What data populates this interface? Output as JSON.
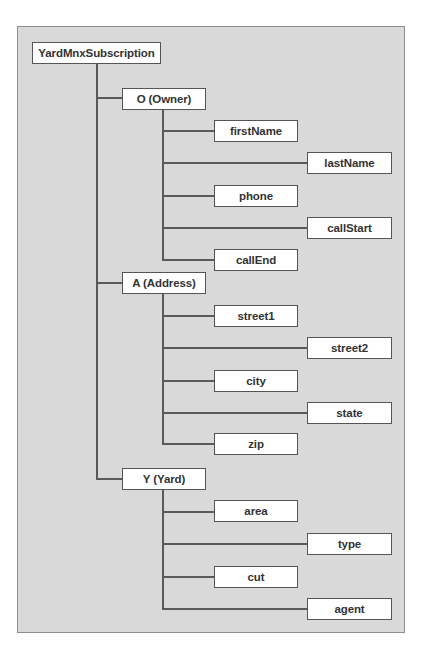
{
  "diagram": {
    "type": "tree",
    "colors": {
      "frame_background": "#d9d9d9",
      "frame_border": "#8e8e8e",
      "node_background": "#ffffff",
      "node_border": "#555555",
      "line": "#5a5a5a",
      "text": "#333333"
    },
    "root": {
      "label": "YardMnxSubscription"
    },
    "groups": [
      {
        "label": "O (Owner)",
        "children": [
          {
            "label": "firstName"
          },
          {
            "label": "lastName"
          },
          {
            "label": "phone"
          },
          {
            "label": "callStart"
          },
          {
            "label": "callEnd"
          }
        ]
      },
      {
        "label": "A (Address)",
        "children": [
          {
            "label": "street1"
          },
          {
            "label": "street2"
          },
          {
            "label": "city"
          },
          {
            "label": "state"
          },
          {
            "label": "zip"
          }
        ]
      },
      {
        "label": "Y (Yard)",
        "children": [
          {
            "label": "area"
          },
          {
            "label": "type"
          },
          {
            "label": "cut"
          },
          {
            "label": "agent"
          }
        ]
      }
    ]
  }
}
